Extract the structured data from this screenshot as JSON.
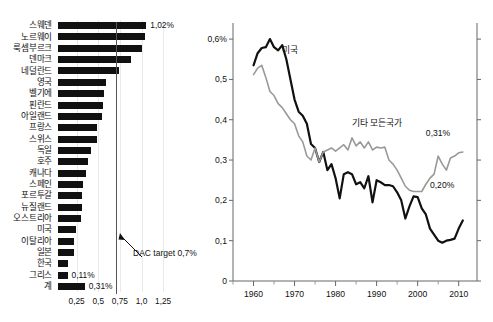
{
  "chart_data": [
    {
      "type": "bar",
      "id": "oda-by-country",
      "title": "",
      "orientation": "horizontal",
      "xlabel": "",
      "ylabel": "",
      "xlim": [
        0,
        1.32
      ],
      "xticks": [
        0.25,
        0.5,
        0.75,
        1.0,
        1.25
      ],
      "xtick_labels": [
        "0,25",
        "0,5",
        "0,75",
        "1,0",
        "1,25"
      ],
      "grid": true,
      "categories": [
        "스웨덴",
        "노르웨이",
        "룩셈부르크",
        "덴마크",
        "네덜란드",
        "영국",
        "벨기에",
        "핀란드",
        "아일랜드",
        "프랑스",
        "스위스",
        "독일",
        "호주",
        "캐나다",
        "스페인",
        "포르투갈",
        "뉴질랜드",
        "오스트리아",
        "미국",
        "이탈리아",
        "일본",
        "한국",
        "그리스",
        "계"
      ],
      "values": [
        1.02,
        1.0,
        0.97,
        0.84,
        0.71,
        0.56,
        0.53,
        0.52,
        0.51,
        0.45,
        0.45,
        0.38,
        0.35,
        0.32,
        0.29,
        0.28,
        0.28,
        0.27,
        0.21,
        0.19,
        0.18,
        0.12,
        0.11,
        0.31
      ],
      "data_labels": {
        "스웨덴": "1,02%",
        "그리스": "0,11%",
        "계": "0,31%"
      },
      "reference_line": {
        "value": 0.7,
        "label": "DAC target 0,7%"
      }
    },
    {
      "type": "line",
      "id": "oda-trend",
      "title": "",
      "xlabel": "",
      "ylabel": "",
      "xlim": [
        1955,
        2013
      ],
      "ylim": [
        0,
        0.63
      ],
      "yticks": [
        0,
        0.1,
        0.2,
        0.3,
        0.4,
        0.5,
        0.6
      ],
      "ytick_labels": [
        "0",
        "0,1",
        "0,2",
        "0,3",
        "0,4",
        "0,5",
        "0,6%"
      ],
      "xticks": [
        1960,
        1970,
        1980,
        1990,
        2000,
        2010
      ],
      "xtick_labels": [
        "1960",
        "1970",
        "1980",
        "1990",
        "2000",
        "2010"
      ],
      "xminorticks": [
        1955,
        1965,
        1975,
        1985,
        1995,
        2005
      ],
      "grid": false,
      "legend_position": "inline-annotation",
      "series": [
        {
          "name": "미국",
          "color": "#111111",
          "label_x": 1967,
          "label_y": 0.575,
          "endpoint_label": "0,20%",
          "x": [
            1960,
            1961,
            1962,
            1963,
            1964,
            1965,
            1966,
            1967,
            1968,
            1969,
            1970,
            1971,
            1972,
            1973,
            1974,
            1975,
            1976,
            1977,
            1978,
            1979,
            1980,
            1981,
            1982,
            1983,
            1984,
            1985,
            1986,
            1987,
            1988,
            1989,
            1990,
            1991,
            1992,
            1993,
            1994,
            1995,
            1996,
            1997,
            1998,
            1999,
            2000,
            2001,
            2002,
            2003,
            2004,
            2005,
            2006,
            2007,
            2008,
            2009,
            2010,
            2011
          ],
          "y": [
            0.535,
            0.565,
            0.578,
            0.58,
            0.6,
            0.58,
            0.572,
            0.585,
            0.55,
            0.5,
            0.45,
            0.42,
            0.41,
            0.39,
            0.34,
            0.33,
            0.295,
            0.32,
            0.275,
            0.29,
            0.255,
            0.205,
            0.265,
            0.27,
            0.265,
            0.24,
            0.245,
            0.23,
            0.26,
            0.195,
            0.25,
            0.245,
            0.238,
            0.238,
            0.235,
            0.22,
            0.2,
            0.155,
            0.185,
            0.21,
            0.208,
            0.18,
            0.165,
            0.13,
            0.115,
            0.1,
            0.095,
            0.1,
            0.102,
            0.105,
            0.13,
            0.15
          ]
        },
        {
          "name": "기타 모든국가",
          "color": "#999999",
          "label_x": 1984,
          "label_y": 0.395,
          "endpoint_label": "0,31%",
          "x": [
            1960,
            1961,
            1962,
            1963,
            1964,
            1965,
            1966,
            1967,
            1968,
            1969,
            1970,
            1971,
            1972,
            1973,
            1974,
            1975,
            1976,
            1977,
            1978,
            1979,
            1980,
            1981,
            1982,
            1983,
            1984,
            1985,
            1986,
            1987,
            1988,
            1989,
            1990,
            1991,
            1992,
            1993,
            1994,
            1995,
            1996,
            1997,
            1998,
            1999,
            2000,
            2001,
            2002,
            2003,
            2004,
            2005,
            2006,
            2007,
            2008,
            2009,
            2010,
            2011
          ],
          "y": [
            0.512,
            0.528,
            0.535,
            0.505,
            0.47,
            0.46,
            0.44,
            0.43,
            0.415,
            0.4,
            0.39,
            0.36,
            0.345,
            0.31,
            0.3,
            0.33,
            0.295,
            0.32,
            0.325,
            0.33,
            0.322,
            0.33,
            0.338,
            0.325,
            0.355,
            0.335,
            0.345,
            0.33,
            0.345,
            0.325,
            0.332,
            0.33,
            0.332,
            0.3,
            0.29,
            0.275,
            0.255,
            0.235,
            0.225,
            0.222,
            0.222,
            0.222,
            0.24,
            0.255,
            0.265,
            0.31,
            0.29,
            0.275,
            0.305,
            0.31,
            0.318,
            0.32
          ]
        }
      ]
    }
  ]
}
